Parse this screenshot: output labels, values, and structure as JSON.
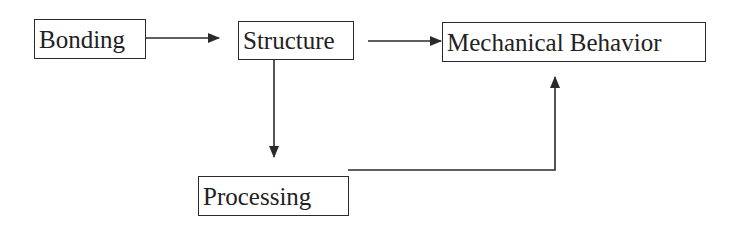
{
  "diagram": {
    "type": "flowchart",
    "nodes": [
      {
        "id": "bonding",
        "label": "Bonding"
      },
      {
        "id": "structure",
        "label": "Structure"
      },
      {
        "id": "mechanical_behavior",
        "label": "Mechanical Behavior"
      },
      {
        "id": "processing",
        "label": "Processing"
      }
    ],
    "edges": [
      {
        "from": "bonding",
        "to": "structure"
      },
      {
        "from": "structure",
        "to": "mechanical_behavior"
      },
      {
        "from": "structure",
        "to": "processing"
      },
      {
        "from": "processing",
        "to": "mechanical_behavior"
      }
    ],
    "line_color": "#2a2a2a"
  }
}
